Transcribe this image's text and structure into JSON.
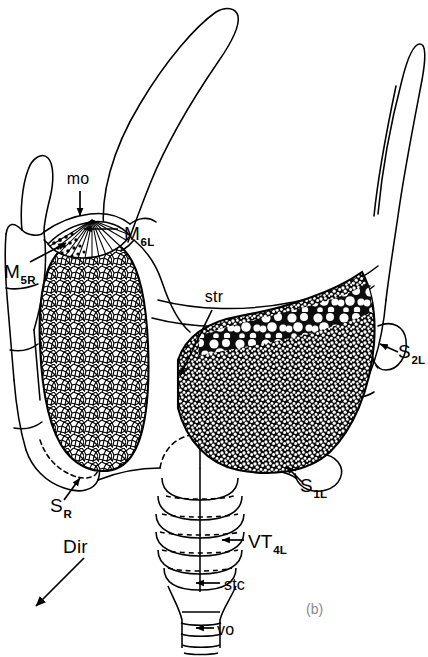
{
  "figure": {
    "panel_label": "(b)",
    "domain_kind": "scientific-line-drawing",
    "background_color": "#ffffff",
    "ink_color": "#000000",
    "panel_label_color": "#8a8a8a"
  },
  "labels": {
    "mo": {
      "text": "mo",
      "sub": "",
      "x": 78,
      "y": 184,
      "anchor": "middle"
    },
    "m6l": {
      "text": "M",
      "sub": "6L",
      "x": 124,
      "y": 236,
      "anchor": "start"
    },
    "m5r": {
      "text": "M",
      "sub": "5R",
      "x": 4,
      "y": 275,
      "anchor": "start"
    },
    "str": {
      "text": "str",
      "sub": "",
      "x": 214,
      "y": 302,
      "anchor": "middle"
    },
    "s2l": {
      "text": "S",
      "sub": "2L",
      "x": 398,
      "y": 356,
      "anchor": "start"
    },
    "s1l": {
      "text": "S",
      "sub": "1L",
      "x": 300,
      "y": 489,
      "anchor": "start"
    },
    "sr": {
      "text": "S",
      "sub": "R",
      "x": 50,
      "y": 509,
      "anchor": "start"
    },
    "dir": {
      "text": "Dir",
      "sub": "",
      "x": 63,
      "y": 551,
      "anchor": "start"
    },
    "vt4l": {
      "text": "VT",
      "sub": "4L",
      "x": 248,
      "y": 546,
      "anchor": "start"
    },
    "stc": {
      "text": "stc",
      "sub": "",
      "x": 224,
      "y": 589,
      "anchor": "start"
    },
    "vo": {
      "text": "vo",
      "sub": "",
      "x": 217,
      "y": 633,
      "anchor": "start"
    }
  },
  "structures": {
    "left_mass": {
      "name": "light-stippled-mass",
      "fill": "#ffffff",
      "texture": "fine-polygonal-cells"
    },
    "right_mass": {
      "name": "dark-stippled-mass",
      "fill": "#1a1a1a",
      "texture": "dense-stipple-with-vacuoles"
    },
    "mo_fan": {
      "name": "radiating-fan",
      "texture": "radial-striae"
    },
    "segments": {
      "name": "ringed-segments",
      "count": 6
    },
    "terminal": {
      "name": "terminal-rings",
      "count": 4
    }
  }
}
